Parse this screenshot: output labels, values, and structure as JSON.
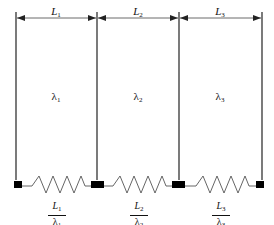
{
  "diagram": {
    "title": "",
    "layers": [
      {
        "length_label": "L",
        "length_sub": "1",
        "conductivity_label": "λ",
        "conductivity_sub": "1",
        "resistance_num": "L",
        "resistance_num_sub": "1",
        "resistance_den": "λ",
        "resistance_den_sub": "1"
      },
      {
        "length_label": "L",
        "length_sub": "2",
        "conductivity_label": "λ",
        "conductivity_sub": "2",
        "resistance_num": "L",
        "resistance_num_sub": "2",
        "resistance_den": "λ",
        "resistance_den_sub": "2"
      },
      {
        "length_label": "L",
        "length_sub": "3",
        "conductivity_label": "λ",
        "conductivity_sub": "3",
        "resistance_num": "L",
        "resistance_num_sub": "3",
        "resistance_den": "λ",
        "resistance_den_sub": "3"
      }
    ],
    "colors": {
      "line": "#222222",
      "node": "#000000",
      "arrow": "#444444"
    }
  }
}
